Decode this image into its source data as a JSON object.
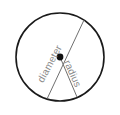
{
  "figure": {
    "background_color": "#ffffff",
    "circle": {
      "name": "circle-outline",
      "center_x": 60,
      "center_y": 57,
      "radius": 44,
      "stroke_color": "#1a1a1a",
      "stroke_width": 1.6,
      "fill": "none"
    },
    "center_point": {
      "name": "center-point",
      "x": 60,
      "y": 57,
      "radius": 3.4,
      "color": "#111111"
    },
    "lines": [
      {
        "id": "diameter-line",
        "label": "diameter",
        "x1": 84,
        "y1": 20,
        "x2": 47,
        "y2": 99,
        "stroke_color": "#6f6f6f",
        "stroke_width": 1.0
      },
      {
        "id": "radius-line",
        "label": "radius",
        "x1": 60,
        "y1": 57,
        "x2": 77,
        "y2": 97,
        "stroke_color": "#6f6f6f",
        "stroke_width": 1.0
      }
    ],
    "labels": {
      "diameter": "diameter",
      "radius": "radius",
      "text_color": "#8a8a8a"
    }
  }
}
